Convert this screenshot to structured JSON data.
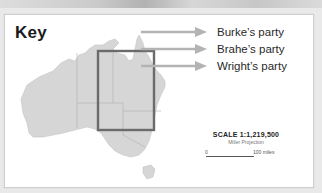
{
  "key": {
    "title": "Key"
  },
  "legend": {
    "items": [
      {
        "label": "Burke’s party",
        "color": "#b3b3b3"
      },
      {
        "label": "Brahe’s party",
        "color": "#b3b3b3"
      },
      {
        "label": "Wright’s party",
        "color": "#b3b3b3"
      }
    ]
  },
  "map": {
    "region": "Australia",
    "land_color": "#d6d6d6",
    "highlight_box_color": "#6b6b6b"
  },
  "scale": {
    "title": "SCALE 1:1,219,500",
    "projection": "Miller Projection",
    "start_label": "0",
    "end_label": "100 miles"
  }
}
